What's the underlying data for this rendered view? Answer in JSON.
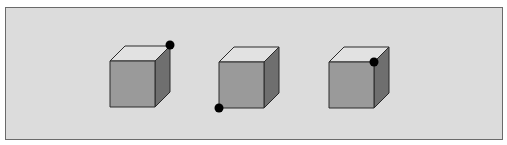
{
  "diagram": {
    "colors": {
      "background": "#dcdcdc",
      "front_face": "#9a9a9a",
      "top_face": "#e2e2e2",
      "side_face": "#6f6f6f",
      "edge": "#2a2a2a",
      "dot": "#000000"
    },
    "cubes": [
      {
        "id": "cube-1",
        "front": {
          "x": 110,
          "y": 61,
          "w": 45,
          "h": 46
        },
        "depth": {
          "dx": 15,
          "dy": -15
        },
        "dot": {
          "vertex": "top-back-right",
          "x": 170,
          "y": 45
        }
      },
      {
        "id": "cube-2",
        "front": {
          "x": 219,
          "y": 62,
          "w": 45,
          "h": 46
        },
        "depth": {
          "dx": 15,
          "dy": -15
        },
        "dot": {
          "vertex": "bottom-front-left",
          "x": 219,
          "y": 108
        }
      },
      {
        "id": "cube-3",
        "front": {
          "x": 329,
          "y": 62,
          "w": 45,
          "h": 46
        },
        "depth": {
          "dx": 15,
          "dy": -15
        },
        "dot": {
          "vertex": "top-front-right",
          "x": 374,
          "y": 62
        }
      }
    ]
  }
}
